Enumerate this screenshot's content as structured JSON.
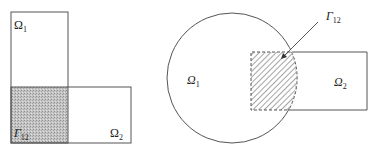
{
  "left_figure": {
    "omega1_label": "Ω",
    "omega1_sub": "1",
    "omega2_label": "Ω",
    "omega2_sub": "2",
    "gamma_label": "Γ",
    "gamma_sub": "12",
    "overlap_fill": "#bdbdbd"
  },
  "right_figure": {
    "omega1_label": "Ω",
    "omega1_sub": "1",
    "omega2_label": "Ω",
    "omega2_sub": "2",
    "gamma_label": "Γ",
    "gamma_sub": "12",
    "hatch_color": "#555555"
  },
  "colors": {
    "stroke": "#555555",
    "background": "#ffffff"
  }
}
